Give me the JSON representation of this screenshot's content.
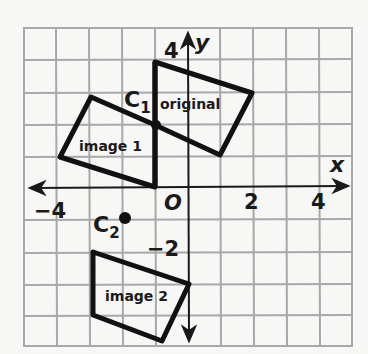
{
  "diagram": {
    "type": "coordinate-plane-dilation",
    "grid": {
      "x_range": [
        -5,
        5
      ],
      "y_range": [
        -5,
        5
      ],
      "unit_px": 32.6,
      "origin_px": [
        188,
        187
      ],
      "grid_color": "#a8a8a8",
      "stroke_color": "#1a1a1a"
    },
    "axes": {
      "x_label": "x",
      "y_label": "y",
      "origin_label": "O",
      "x_ticks": [
        {
          "value": -4,
          "label": "−4"
        },
        {
          "value": 2,
          "label": "2"
        },
        {
          "value": 4,
          "label": "4"
        }
      ],
      "y_ticks": [
        {
          "value": 4,
          "label": "4"
        },
        {
          "value": -2,
          "label": "−2"
        }
      ]
    },
    "points": [
      {
        "name": "C1",
        "label_main": "C",
        "label_sub": "1",
        "coords": [
          -1,
          2
        ]
      },
      {
        "name": "C2",
        "label_main": "C",
        "label_sub": "2",
        "coords": [
          -2,
          -1
        ]
      }
    ],
    "shapes": [
      {
        "name": "original",
        "label": "original",
        "vertices": [
          [
            -1,
            4
          ],
          [
            2,
            3
          ],
          [
            1,
            1
          ],
          [
            -1,
            2
          ]
        ]
      },
      {
        "name": "image 1",
        "label": "image 1",
        "vertices": [
          [
            -2,
            3
          ],
          [
            -4,
            1
          ],
          [
            -1,
            0
          ],
          [
            -1,
            2
          ]
        ]
      },
      {
        "name": "image 2",
        "label": "image 2",
        "vertices": [
          [
            -3,
            -2
          ],
          [
            0,
            -3
          ],
          [
            -1,
            -5
          ],
          [
            -3,
            -4
          ]
        ]
      }
    ]
  }
}
